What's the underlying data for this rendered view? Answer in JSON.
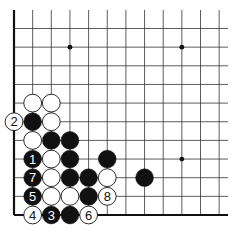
{
  "board": {
    "origin_x": 14,
    "origin_y": 215,
    "spacing": 18.65,
    "cols": 12,
    "rows": 12,
    "right_extent": 228,
    "top_extent": 10,
    "edges": [
      "left",
      "bottom"
    ],
    "line_color": "#333333",
    "edge_color": "#111111"
  },
  "star_points": [
    {
      "col": 3,
      "row": 9
    },
    {
      "col": 9,
      "row": 9
    },
    {
      "col": 9,
      "row": 3
    }
  ],
  "stones": [
    {
      "color": "white",
      "col": 1,
      "row": 6,
      "label": ""
    },
    {
      "color": "white",
      "col": 2,
      "row": 6,
      "label": ""
    },
    {
      "color": "white",
      "col": 0,
      "row": 5,
      "label": "2"
    },
    {
      "color": "black",
      "col": 1,
      "row": 5,
      "label": ""
    },
    {
      "color": "white",
      "col": 2,
      "row": 5,
      "label": ""
    },
    {
      "color": "white",
      "col": 1,
      "row": 4,
      "label": ""
    },
    {
      "color": "black",
      "col": 2,
      "row": 4,
      "label": ""
    },
    {
      "color": "black",
      "col": 3,
      "row": 4,
      "label": ""
    },
    {
      "color": "black",
      "col": 1,
      "row": 3,
      "label": "1"
    },
    {
      "color": "white",
      "col": 2,
      "row": 3,
      "label": ""
    },
    {
      "color": "black",
      "col": 3,
      "row": 3,
      "label": ""
    },
    {
      "color": "black",
      "col": 5,
      "row": 3,
      "label": ""
    },
    {
      "color": "black",
      "col": 1,
      "row": 2,
      "label": "7"
    },
    {
      "color": "white",
      "col": 2,
      "row": 2,
      "label": ""
    },
    {
      "color": "black",
      "col": 3,
      "row": 2,
      "label": ""
    },
    {
      "color": "black",
      "col": 4,
      "row": 2,
      "label": ""
    },
    {
      "color": "white",
      "col": 5,
      "row": 2,
      "label": ""
    },
    {
      "color": "black",
      "col": 7,
      "row": 2,
      "label": ""
    },
    {
      "color": "black",
      "col": 1,
      "row": 1,
      "label": "5"
    },
    {
      "color": "white",
      "col": 2,
      "row": 1,
      "label": ""
    },
    {
      "color": "white",
      "col": 3,
      "row": 1,
      "label": ""
    },
    {
      "color": "black",
      "col": 4,
      "row": 1,
      "label": ""
    },
    {
      "color": "white",
      "col": 5,
      "row": 1,
      "label": "8"
    },
    {
      "color": "white",
      "col": 1,
      "row": 0,
      "label": "4"
    },
    {
      "color": "black",
      "col": 2,
      "row": 0,
      "label": "3"
    },
    {
      "color": "black",
      "col": 3,
      "row": 0,
      "label": ""
    },
    {
      "color": "white",
      "col": 4,
      "row": 0,
      "label": "6"
    }
  ]
}
